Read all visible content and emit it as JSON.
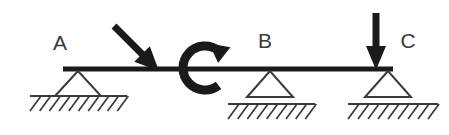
{
  "figure": {
    "type": "beam-free-body-diagram",
    "background_color": "#ffffff",
    "ink_color": "#1a1a1a",
    "label_color": "#3a3a3a",
    "width": 449,
    "height": 135
  },
  "beam": {
    "name": "beam-member",
    "x_start": 63,
    "x_end": 393,
    "y": 69,
    "thickness": 5,
    "color": "#1a1a1a"
  },
  "labels": {
    "point_a": "A",
    "point_b": "B",
    "point_c": "C"
  },
  "supports": [
    {
      "id": "support-a",
      "label": "A",
      "kind": "pin",
      "apex_x": 78,
      "apex_y": 71,
      "half_width": 23,
      "base_y": 96,
      "ground_y": 96,
      "hatch_x_start": 30,
      "hatch_x_end": 127,
      "hatch_count": 10,
      "label_x": 60,
      "label_y": 50
    },
    {
      "id": "support-b",
      "label": "B",
      "kind": "roller",
      "apex_x": 270,
      "apex_y": 71,
      "half_width": 23,
      "base_y": 97,
      "ground_y": 104,
      "hatch_x_start": 228,
      "hatch_x_end": 315,
      "hatch_count": 9,
      "label_x": 265,
      "label_y": 48
    },
    {
      "id": "support-c",
      "label": "C",
      "kind": "roller",
      "apex_x": 388,
      "apex_y": 71,
      "half_width": 23,
      "base_y": 97,
      "ground_y": 104,
      "hatch_x_start": 348,
      "hatch_x_end": 438,
      "hatch_count": 9,
      "label_x": 408,
      "label_y": 48
    }
  ],
  "loads": [
    {
      "id": "inclined-point-load",
      "kind": "inclined-force-arrow",
      "direction": "down-right",
      "angle_degrees": 45,
      "tail_x": 114,
      "tail_y": 26,
      "tip_x": 159,
      "tip_y": 71,
      "shaft_width": 7,
      "head_length": 24,
      "head_half_width": 11
    },
    {
      "id": "applied-moment",
      "kind": "moment-couple-arrow",
      "sense": "clockwise",
      "center_x": 205,
      "center_y": 68,
      "radius": 22,
      "stroke_width": 9,
      "gap_start_degrees": -52,
      "gap_end_degrees": 52,
      "head_half_width": 10,
      "head_length": 19
    },
    {
      "id": "vertical-point-load",
      "kind": "vertical-force-arrow",
      "direction": "down",
      "x": 376,
      "tail_y": 13,
      "tip_y": 70,
      "shaft_width": 7,
      "head_length": 24,
      "head_half_width": 10
    }
  ]
}
